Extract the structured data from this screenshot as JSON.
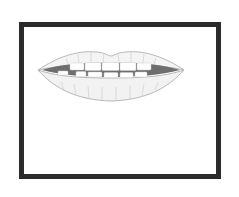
{
  "image": {
    "subject": "lips-with-teeth",
    "description": "Pencil-style drawing of slightly parted lips showing upper and lower teeth, inside a thick dark rectangular frame",
    "colors": {
      "frame": "#2b2b2b",
      "background": "#ffffff",
      "lip_outline": "#bdbdbd",
      "mouth_interior": "#6e6e6e",
      "teeth": "#ffffff"
    }
  }
}
